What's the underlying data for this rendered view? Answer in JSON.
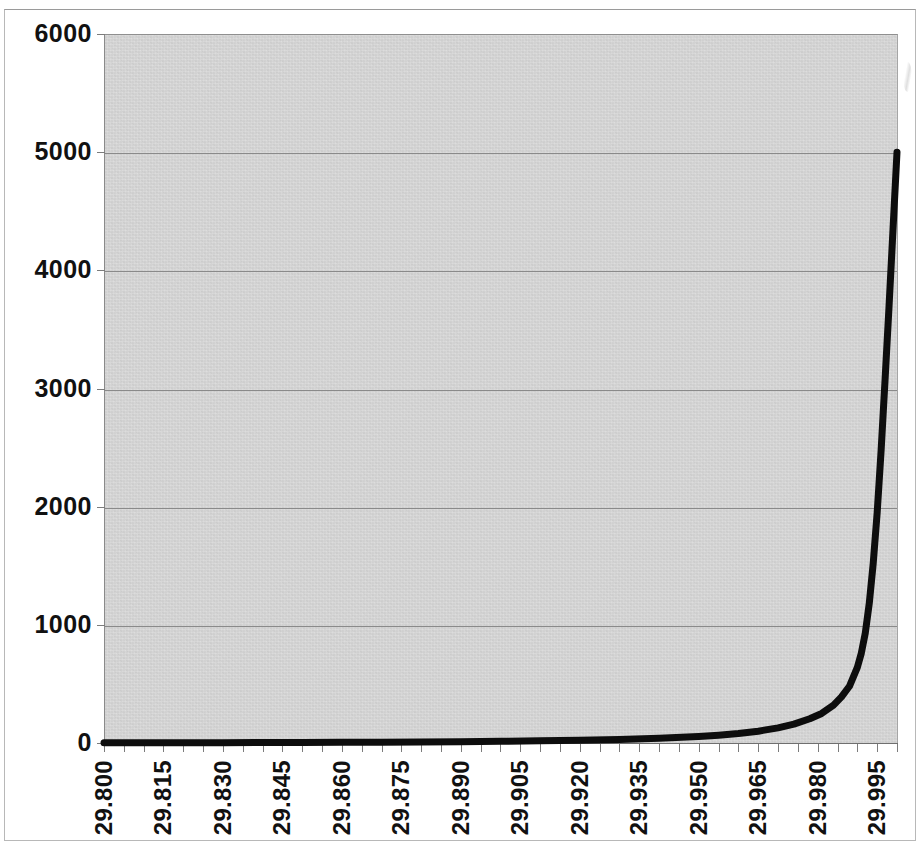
{
  "chart_data": {
    "type": "line",
    "title": "",
    "subtitle": "",
    "xlabel": "",
    "ylabel": "",
    "legend": [],
    "legend_position": "none",
    "grid": true,
    "grid_axis": "y",
    "plot_background": "#d6d6d6",
    "series_color": "#0d0d0d",
    "xlim": [
      29.8,
      30.0
    ],
    "ylim": [
      0,
      6000
    ],
    "y_tick_interval": 1000,
    "x_tick_interval": 0.005,
    "x_label_interval": 0.015,
    "y_ticks": [
      "6000",
      "5000",
      "4000",
      "3000",
      "2000",
      "1000",
      "0"
    ],
    "y_tick_values": [
      6000,
      5000,
      4000,
      3000,
      2000,
      1000,
      0
    ],
    "x_ticks": [
      "29.800",
      "29.815",
      "29.830",
      "29.845",
      "29.860",
      "29.875",
      "29.890",
      "29.905",
      "29.920",
      "29.935",
      "29.950",
      "29.965",
      "29.980",
      "29.995"
    ],
    "x_tick_values": [
      29.8,
      29.815,
      29.83,
      29.845,
      29.86,
      29.875,
      29.89,
      29.905,
      29.92,
      29.935,
      29.95,
      29.965,
      29.98,
      29.995
    ],
    "x_minor_tick_count": 40,
    "series": [
      {
        "name": "",
        "x": [
          29.8,
          29.81,
          29.82,
          29.83,
          29.84,
          29.85,
          29.86,
          29.87,
          29.88,
          29.89,
          29.9,
          29.91,
          29.92,
          29.93,
          29.94,
          29.95,
          29.955,
          29.96,
          29.965,
          29.97,
          29.974,
          29.978,
          29.981,
          29.984,
          29.986,
          29.988,
          29.99,
          29.991,
          29.992,
          29.993,
          29.994,
          29.995,
          29.996,
          29.997,
          29.998,
          29.999,
          30.0
        ],
        "values": [
          2,
          2,
          3,
          3,
          4,
          5,
          6,
          7,
          9,
          11,
          14,
          18,
          23,
          30,
          40,
          55,
          66,
          80,
          100,
          128,
          160,
          205,
          250,
          320,
          390,
          480,
          640,
          760,
          930,
          1180,
          1520,
          1950,
          2480,
          3080,
          3700,
          4350,
          5000
        ]
      }
    ]
  }
}
